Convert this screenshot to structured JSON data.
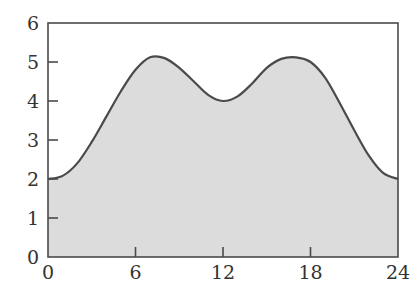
{
  "chart_data": {
    "type": "area",
    "title": "",
    "xlabel": "",
    "ylabel": "",
    "xlim": [
      0,
      24
    ],
    "ylim": [
      0,
      6
    ],
    "grid": false,
    "legend": null,
    "x_ticks": [
      0,
      6,
      12,
      18,
      24
    ],
    "y_ticks": [
      0,
      1,
      2,
      3,
      4,
      5,
      6
    ],
    "x": [
      0,
      1,
      2,
      3,
      4,
      5,
      6,
      7,
      8,
      9,
      10,
      11,
      12,
      13,
      14,
      15,
      16,
      17,
      18,
      19,
      20,
      21,
      22,
      23,
      24
    ],
    "series": [
      {
        "name": "curve",
        "values": [
          2.0,
          2.08,
          2.4,
          2.95,
          3.6,
          4.25,
          4.8,
          5.12,
          5.1,
          4.85,
          4.5,
          4.15,
          4.0,
          4.12,
          4.45,
          4.85,
          5.08,
          5.12,
          5.0,
          4.6,
          3.95,
          3.25,
          2.6,
          2.15,
          2.0
        ]
      }
    ],
    "colors": {
      "fill": "#dcdcdc",
      "line": "#4a4a4a",
      "axis": "#4a4a4a"
    }
  }
}
